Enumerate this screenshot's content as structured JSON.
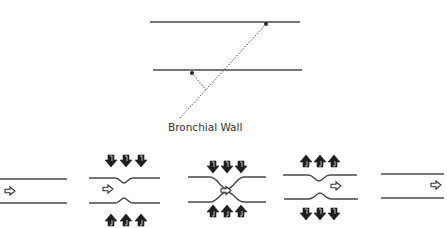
{
  "diagram": {
    "top_figure": {
      "label": "Bronchial Wall",
      "walls": [
        {
          "x1": 150,
          "y1": 22,
          "x2": 300,
          "y2": 22
        },
        {
          "x1": 153,
          "y1": 70,
          "x2": 302,
          "y2": 70
        }
      ],
      "pointers": [
        {
          "from": [
            266,
            24
          ],
          "to": [
            180,
            118
          ]
        },
        {
          "from": [
            192,
            73
          ],
          "to": [
            206,
            90
          ]
        }
      ]
    },
    "panels": [
      {
        "id": "panel-1",
        "state": "open airway",
        "flow_arrow_x": 8,
        "external_pressure": "none"
      },
      {
        "id": "panel-2",
        "state": "early compression",
        "flow_arrow_x": 104,
        "external_pressure": "inward"
      },
      {
        "id": "panel-3",
        "state": "airway collapse",
        "flow_arrow_x": 220,
        "external_pressure": "inward"
      },
      {
        "id": "panel-4",
        "state": "re-opening",
        "flow_arrow_x": 330,
        "external_pressure": "outward"
      },
      {
        "id": "panel-5",
        "state": "open airway",
        "flow_arrow_x": 432,
        "external_pressure": "none"
      }
    ],
    "colors": {
      "line": "#4a4a4a",
      "arrow_fill": "#1e1e1e",
      "background": "#ffffff"
    }
  }
}
